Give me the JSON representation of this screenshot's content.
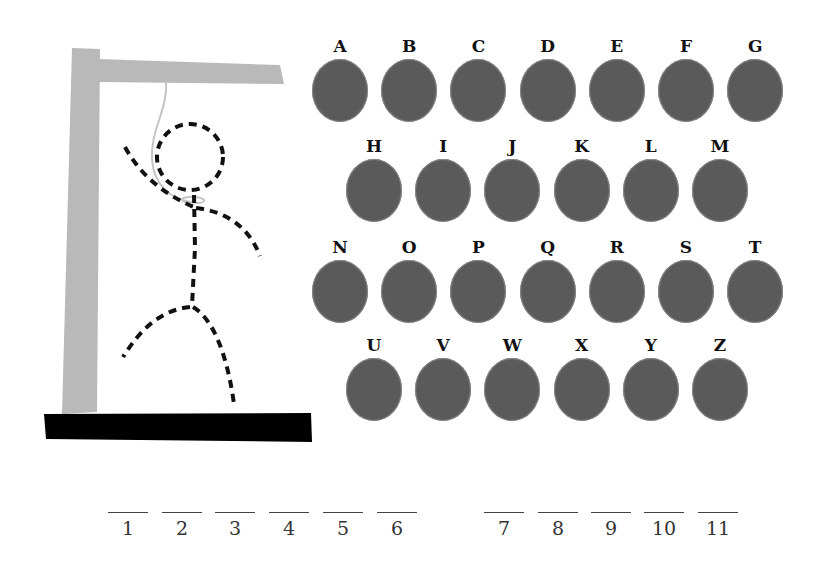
{
  "colors": {
    "gallows": "#b9b9b9",
    "base": "#000000",
    "rope": "#c4c4c4",
    "figure": "#111111",
    "disc": "#5a5a5a",
    "label": "#111111"
  },
  "gallows": {
    "parts": [
      "post",
      "beam",
      "base",
      "rope"
    ],
    "figure_parts": [
      "head",
      "body",
      "left-arm",
      "right-arm",
      "left-leg",
      "right-leg"
    ],
    "figure_style": "dashed"
  },
  "letters": {
    "row1": [
      "A",
      "B",
      "C",
      "D",
      "E",
      "F",
      "G"
    ],
    "row2": [
      "H",
      "I",
      "J",
      "K",
      "L",
      "M"
    ],
    "row3": [
      "N",
      "O",
      "P",
      "Q",
      "R",
      "S",
      "T"
    ],
    "row4": [
      "U",
      "V",
      "W",
      "X",
      "Y",
      "Z"
    ]
  },
  "word": {
    "group1": [
      "1",
      "2",
      "3",
      "4",
      "5",
      "6"
    ],
    "group2": [
      "7",
      "8",
      "9",
      "10",
      "11"
    ]
  }
}
